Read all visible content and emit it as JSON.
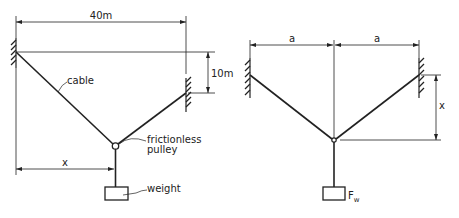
{
  "figure_left": {
    "span_label": "40m",
    "height_diff_label": "10m",
    "cable_label": "cable",
    "pulley_label_line1": "frictionless",
    "pulley_label_line2": "pulley",
    "horizontal_pos_label": "x",
    "weight_label": "weight"
  },
  "figure_right": {
    "half_span_left_label": "a",
    "half_span_right_label": "a",
    "sag_label": "x",
    "weight_label_main": "F",
    "weight_label_sub": "w"
  },
  "colors": {
    "line": "#222222",
    "background": "#ffffff"
  }
}
